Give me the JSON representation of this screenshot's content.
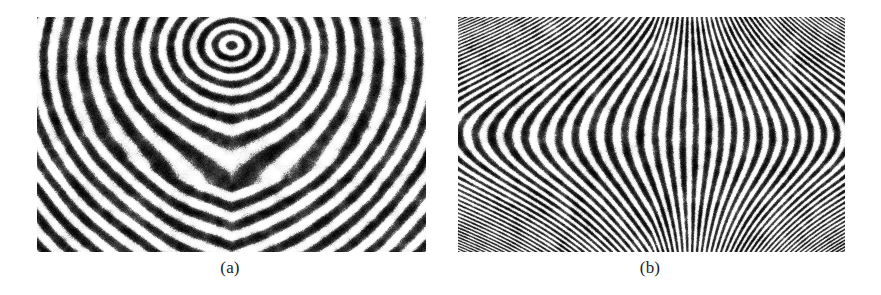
{
  "figure": {
    "background_color": "#ffffff",
    "width": 881,
    "height": 295,
    "ink_color": "#232323"
  },
  "panels": [
    {
      "id": "a",
      "caption": "(a)",
      "pattern_name": "loop-core-ridge-flow",
      "description": "Fingerprint ridge orientation field with a loop / arch core near the upper center",
      "x": 37,
      "y": 17,
      "width": 389,
      "height": 235,
      "core": {
        "x_frac": 0.5,
        "y_frac": 0.12
      },
      "ridge_period_px": 13.5,
      "noise_amount": 0.55,
      "contrast": 1.25
    },
    {
      "id": "b",
      "caption": "(b)",
      "pattern_name": "delta-hourglass-ridge-flow",
      "description": "Fingerprint ridge orientation field with a delta producing an hourglass shape at the center",
      "x": 458,
      "y": 17,
      "width": 387,
      "height": 235,
      "core": {
        "x_frac": 0.5,
        "y_frac": 0.5
      },
      "ridge_period_px": 14.5,
      "noise_amount": 0.55,
      "contrast": 1.25
    }
  ],
  "chart_data": {
    "type": "heatmap",
    "title": "",
    "xlabel": "",
    "ylabel": "",
    "subplots": [
      {
        "label": "(a)",
        "field": "sinusoidal ridge texture",
        "singularity": "core (loop)",
        "singularity_position": [
          0.5,
          0.12
        ],
        "ridge_wavelength_px": 13.5,
        "orientation_left_deg": 45,
        "orientation_right_deg": -45,
        "colormap": "grayscale"
      },
      {
        "label": "(b)",
        "field": "sinusoidal ridge texture",
        "singularity": "delta",
        "singularity_position": [
          0.5,
          0.5
        ],
        "ridge_wavelength_px": 14.5,
        "orientation_left_deg": 90,
        "orientation_right_deg": 90,
        "colormap": "grayscale"
      }
    ]
  }
}
